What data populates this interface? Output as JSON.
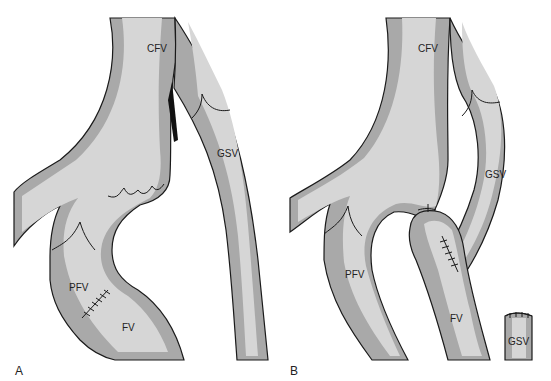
{
  "figure": {
    "panels": [
      {
        "id": "A",
        "panel_label": "A",
        "labels": {
          "cfv": "CFV",
          "gsv": "GSV",
          "pfv": "PFV",
          "fv": "FV"
        }
      },
      {
        "id": "B",
        "panel_label": "B",
        "labels": {
          "cfv": "CFV",
          "gsv": "GSV",
          "pfv": "PFV",
          "fv": "FV",
          "gsv_stump": "GSV"
        }
      }
    ],
    "colors": {
      "vein_wall": "#a9a9a9",
      "vein_lumen": "#d6d6d6",
      "outline": "#1a1a1a",
      "background": "#ffffff"
    }
  }
}
